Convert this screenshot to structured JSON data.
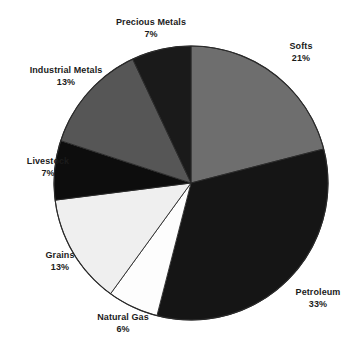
{
  "chart_data": {
    "type": "pie",
    "title": "",
    "subtitle": "",
    "xlabel": "",
    "ylabel": "",
    "legend_position": "none",
    "grid": false,
    "unit": "%",
    "start_angle_deg": 0,
    "direction": "clockwise",
    "categories": [
      "Softs",
      "Petroleum",
      "Natural Gas",
      "Grains",
      "Livestock",
      "Industrial Metals",
      "Precious Metals"
    ],
    "values": [
      21,
      33,
      6,
      13,
      7,
      13,
      7
    ],
    "slices": [
      {
        "label": "Softs",
        "value": 21,
        "percent_text": "21%",
        "color": "#6e6e6e",
        "start_deg": 0,
        "end_deg": 75.6,
        "label_pos": "right-top"
      },
      {
        "label": "Petroleum",
        "value": 33,
        "percent_text": "33%",
        "color": "#151515",
        "start_deg": 75.6,
        "end_deg": 194.4,
        "label_pos": "right-bottom"
      },
      {
        "label": "Natural Gas",
        "value": 6,
        "percent_text": "6%",
        "color": "#fdfdfd",
        "start_deg": 194.4,
        "end_deg": 216.0,
        "label_pos": "bottom"
      },
      {
        "label": "Grains",
        "value": 13,
        "percent_text": "13%",
        "color": "#efefef",
        "start_deg": 216.0,
        "end_deg": 262.8,
        "label_pos": "left-bottom"
      },
      {
        "label": "Livestock",
        "value": 7,
        "percent_text": "7%",
        "color": "#0d0d0d",
        "start_deg": 262.8,
        "end_deg": 288.0,
        "label_pos": "left"
      },
      {
        "label": "Industrial Metals",
        "value": 13,
        "percent_text": "13%",
        "color": "#565656",
        "start_deg": 288.0,
        "end_deg": 334.8,
        "label_pos": "left-top"
      },
      {
        "label": "Precious Metals",
        "value": 7,
        "percent_text": "7%",
        "color": "#1a1a1a",
        "start_deg": 334.8,
        "end_deg": 360.0,
        "label_pos": "top"
      }
    ]
  },
  "labels": {
    "softs": {
      "name": "Softs",
      "pct": "21%"
    },
    "petroleum": {
      "name": "Petroleum",
      "pct": "33%"
    },
    "natural_gas": {
      "name": "Natural Gas",
      "pct": "6%"
    },
    "grains": {
      "name": "Grains",
      "pct": "13%"
    },
    "livestock": {
      "name": "Livestock",
      "pct": "7%"
    },
    "industrial_metals": {
      "name": "Industrial Metals",
      "pct": "13%"
    },
    "precious_metals": {
      "name": "Precious Metals",
      "pct": "7%"
    }
  },
  "geometry": {
    "center_x": 191,
    "center_y": 183,
    "radius": 137
  },
  "colors": {
    "background": "#ffffff",
    "outline": "#2a2a2a",
    "text": "#1b1b1b"
  }
}
